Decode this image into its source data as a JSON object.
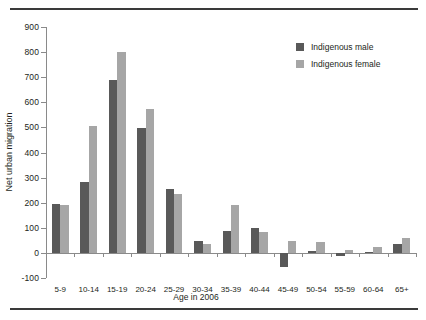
{
  "chart_data": {
    "type": "bar",
    "title": "",
    "xlabel": "Age in 2006",
    "ylabel": "Net urban migration",
    "categories": [
      "5-9",
      "10-14",
      "15-19",
      "20-24",
      "25-29",
      "30-34",
      "35-39",
      "40-44",
      "45-49",
      "50-54",
      "55-59",
      "60-64",
      "65+"
    ],
    "series": [
      {
        "name": "Indigenous male",
        "color": "#595959",
        "values": [
          193,
          283,
          690,
          498,
          255,
          48,
          88,
          98,
          -55,
          8,
          -12,
          5,
          35
        ]
      },
      {
        "name": "Indigenous female",
        "color": "#a6a6a6",
        "values": [
          190,
          505,
          800,
          572,
          233,
          35,
          190,
          85,
          48,
          43,
          12,
          25,
          60
        ]
      }
    ],
    "ylim": [
      -100,
      900
    ],
    "ytick_labels": [
      "900",
      "800",
      "700",
      "600",
      "500",
      "400",
      "300",
      "200",
      "100",
      "0",
      "-100"
    ],
    "ytick_values": [
      900,
      800,
      700,
      600,
      500,
      400,
      300,
      200,
      100,
      0,
      -100
    ],
    "grid": false,
    "legend_position": "top-right"
  },
  "legend": {
    "items": [
      {
        "label": "Indigenous male",
        "swatch": "male"
      },
      {
        "label": "Indigenous female",
        "swatch": "female"
      }
    ]
  },
  "colors": {
    "male": "#595959",
    "female": "#a6a6a6",
    "axis": "#8a8a8a",
    "rule": "#3a3a3a",
    "text": "#231f20"
  }
}
